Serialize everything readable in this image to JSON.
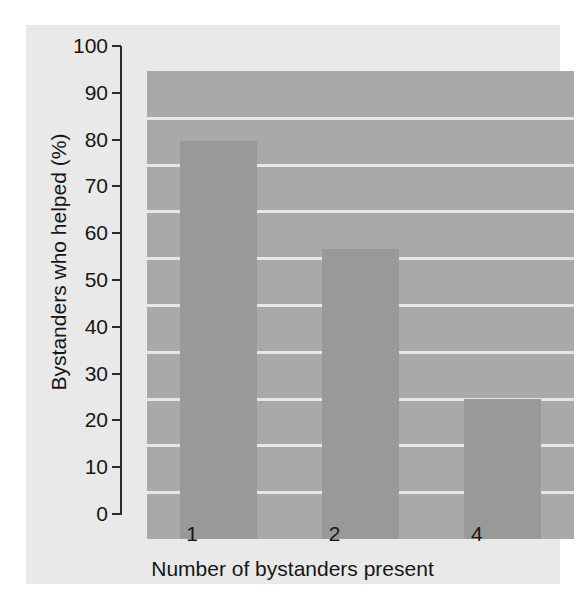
{
  "chart_data": {
    "type": "bar",
    "title": "",
    "categories": [
      "1",
      "2",
      "4"
    ],
    "values": [
      85,
      62,
      30
    ],
    "series": [
      {
        "name": "Bystanders who helped (%)",
        "values": [
          85,
          62,
          30
        ]
      }
    ],
    "xlabel": "Number of bystanders present",
    "ylabel": "Bystanders who helped (%)",
    "ylim": [
      0,
      100
    ],
    "ytick_labels": [
      "0",
      "10",
      "20",
      "30",
      "40",
      "50",
      "60",
      "70",
      "80",
      "90",
      "100"
    ],
    "ytick_values": [
      0,
      10,
      20,
      30,
      40,
      50,
      60,
      70,
      80,
      90,
      100
    ],
    "xtick_labels": [
      "1",
      "2",
      "4"
    ],
    "grid": true,
    "legend": false,
    "legend_position": "none",
    "colors": {
      "figure_background": "#e9e9e9",
      "plot_background": "#a9a9a9",
      "bar_fill": "#999999",
      "gridline": "#e6e6e6",
      "axis": "#2b2b2b",
      "text": "#161616"
    }
  }
}
